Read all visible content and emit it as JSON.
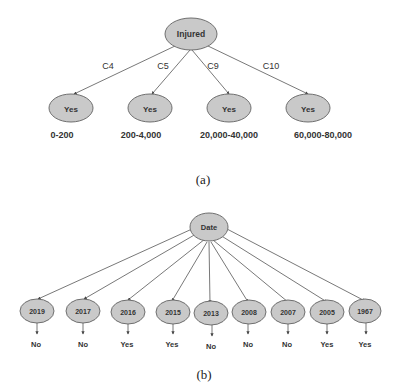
{
  "panel_a": {
    "caption": "(a)",
    "root": {
      "label": "Injured"
    },
    "children": [
      {
        "edge_label": "C4",
        "node_label": "Yes",
        "range": "0-200"
      },
      {
        "edge_label": "C5",
        "node_label": "Yes",
        "range": "200-4,000"
      },
      {
        "edge_label": "C9",
        "node_label": "Yes",
        "range": "20,000-40,000"
      },
      {
        "edge_label": "C10",
        "node_label": "Yes",
        "range": "60,000-80,000"
      }
    ]
  },
  "panel_b": {
    "caption": "(b)",
    "root": {
      "label": "Date"
    },
    "children": [
      {
        "node_label": "2019",
        "outcome": "No"
      },
      {
        "node_label": "2017",
        "outcome": "No"
      },
      {
        "node_label": "2016",
        "outcome": "Yes"
      },
      {
        "node_label": "2015",
        "outcome": "Yes"
      },
      {
        "node_label": "2013",
        "outcome": "No"
      },
      {
        "node_label": "2008",
        "outcome": "No"
      },
      {
        "node_label": "2007",
        "outcome": "No"
      },
      {
        "node_label": "2005",
        "outcome": "Yes"
      },
      {
        "node_label": "1967",
        "outcome": "Yes"
      }
    ]
  },
  "colors": {
    "node_fill": "#c9c9c9",
    "node_stroke": "#6f6f6f",
    "edge": "#555555",
    "text": "#333333"
  }
}
